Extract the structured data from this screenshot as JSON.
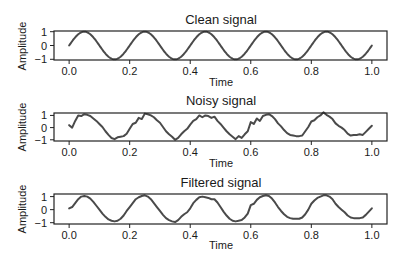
{
  "figure": {
    "width": 409,
    "height": 261,
    "line_color": "#4a4a4a",
    "axis_color": "#222222"
  },
  "chart_data": [
    {
      "type": "line",
      "title": "Clean signal",
      "xlabel": "Time",
      "ylabel": "Amplitude",
      "xlim": [
        -0.05,
        1.05
      ],
      "ylim": [
        -1.05,
        1.05
      ],
      "xticks": [
        0.0,
        0.2,
        0.4,
        0.6,
        0.8,
        1.0
      ],
      "xtick_labels": [
        "0.0",
        "0.2",
        "0.4",
        "0.6",
        "0.8",
        "1.0"
      ],
      "yticks": [
        1,
        0,
        -1
      ],
      "ytick_labels": [
        "1",
        "0",
        "−1"
      ],
      "grid": false,
      "description": "Sine wave, 5 cycles over t in [0,1], amplitude 1",
      "x": [
        0.0,
        0.025,
        0.05,
        0.075,
        0.1,
        0.125,
        0.15,
        0.175,
        0.2,
        0.225,
        0.25,
        0.275,
        0.3,
        0.325,
        0.35,
        0.375,
        0.4,
        0.425,
        0.45,
        0.475,
        0.5,
        0.525,
        0.55,
        0.575,
        0.6,
        0.625,
        0.65,
        0.675,
        0.7,
        0.725,
        0.75,
        0.775,
        0.8,
        0.825,
        0.85,
        0.875,
        0.9,
        0.925,
        0.95,
        0.975,
        1.0
      ],
      "values": [
        0.0,
        0.71,
        1.0,
        0.71,
        0.0,
        -0.71,
        -1.0,
        -0.71,
        0.0,
        0.71,
        1.0,
        0.71,
        0.0,
        -0.71,
        -1.0,
        -0.71,
        0.0,
        0.71,
        1.0,
        0.71,
        0.0,
        -0.71,
        -1.0,
        -0.71,
        0.0,
        0.71,
        1.0,
        0.71,
        0.0,
        -0.71,
        -1.0,
        -0.71,
        0.0,
        0.71,
        1.0,
        0.71,
        0.0,
        -0.71,
        -1.0,
        -0.71,
        0.0
      ]
    },
    {
      "type": "line",
      "title": "Noisy signal",
      "xlabel": "Time",
      "ylabel": "Amplitude",
      "xlim": [
        -0.05,
        1.05
      ],
      "ylim": [
        -1.1,
        1.2
      ],
      "xticks": [
        0.0,
        0.2,
        0.4,
        0.6,
        0.8,
        1.0
      ],
      "xtick_labels": [
        "0.0",
        "0.2",
        "0.4",
        "0.6",
        "0.8",
        "1.0"
      ],
      "yticks": [
        1,
        0,
        -1
      ],
      "ytick_labels": [
        "1",
        "0",
        "−1"
      ],
      "grid": false,
      "x": [
        0.0,
        0.01,
        0.02,
        0.03,
        0.04,
        0.05,
        0.06,
        0.07,
        0.08,
        0.09,
        0.1,
        0.11,
        0.12,
        0.13,
        0.14,
        0.15,
        0.16,
        0.17,
        0.18,
        0.19,
        0.2,
        0.21,
        0.22,
        0.23,
        0.24,
        0.25,
        0.26,
        0.27,
        0.28,
        0.29,
        0.3,
        0.31,
        0.32,
        0.33,
        0.34,
        0.35,
        0.36,
        0.37,
        0.38,
        0.39,
        0.4,
        0.41,
        0.42,
        0.43,
        0.44,
        0.45,
        0.46,
        0.47,
        0.48,
        0.49,
        0.5,
        0.51,
        0.52,
        0.53,
        0.54,
        0.55,
        0.56,
        0.57,
        0.58,
        0.59,
        0.6,
        0.61,
        0.62,
        0.63,
        0.64,
        0.65,
        0.66,
        0.67,
        0.68,
        0.69,
        0.7,
        0.71,
        0.72,
        0.73,
        0.74,
        0.75,
        0.76,
        0.77,
        0.78,
        0.79,
        0.8,
        0.81,
        0.82,
        0.83,
        0.84,
        0.85,
        0.86,
        0.87,
        0.88,
        0.89,
        0.9,
        0.91,
        0.92,
        0.93,
        0.94,
        0.95,
        0.96,
        0.97,
        0.98,
        0.99,
        1.0
      ],
      "values": [
        0.2,
        0.0,
        0.55,
        1.0,
        0.95,
        1.1,
        1.05,
        0.95,
        0.75,
        0.55,
        0.3,
        0.05,
        -0.3,
        -0.6,
        -0.85,
        -0.95,
        -0.8,
        -0.75,
        -0.7,
        -0.5,
        -0.1,
        0.3,
        0.4,
        0.8,
        0.7,
        1.15,
        1.1,
        1.0,
        0.85,
        0.6,
        0.4,
        0.05,
        -0.3,
        -0.55,
        -0.75,
        -1.0,
        -0.85,
        -0.55,
        -0.3,
        -0.1,
        0.25,
        0.55,
        0.7,
        1.0,
        0.85,
        1.0,
        0.95,
        0.8,
        0.9,
        0.55,
        0.3,
        0.0,
        -0.3,
        -0.55,
        -0.75,
        -0.95,
        -0.7,
        -0.85,
        -0.55,
        -0.3,
        0.45,
        0.3,
        0.75,
        0.55,
        0.95,
        1.05,
        1.1,
        0.95,
        0.7,
        0.35,
        0.1,
        -0.2,
        -0.45,
        -0.6,
        -0.65,
        -0.7,
        -0.7,
        -0.65,
        -0.3,
        0.05,
        0.5,
        0.6,
        0.85,
        1.0,
        1.25,
        1.05,
        0.9,
        0.7,
        0.35,
        0.15,
        0.0,
        -0.2,
        -0.5,
        -0.65,
        -0.6,
        -0.6,
        -0.55,
        -0.6,
        -0.35,
        -0.1,
        0.15
      ]
    },
    {
      "type": "line",
      "title": "Filtered signal",
      "xlabel": "Time",
      "ylabel": "Amplitude",
      "xlim": [
        -0.05,
        1.05
      ],
      "ylim": [
        -1.1,
        1.2
      ],
      "xticks": [
        0.0,
        0.2,
        0.4,
        0.6,
        0.8,
        1.0
      ],
      "xtick_labels": [
        "0.0",
        "0.2",
        "0.4",
        "0.6",
        "0.8",
        "1.0"
      ],
      "yticks": [
        1,
        0,
        -1
      ],
      "ytick_labels": [
        "1",
        "0",
        "−1"
      ],
      "grid": false,
      "x": [
        0.0,
        0.01,
        0.02,
        0.03,
        0.04,
        0.05,
        0.06,
        0.07,
        0.08,
        0.09,
        0.1,
        0.11,
        0.12,
        0.13,
        0.14,
        0.15,
        0.16,
        0.17,
        0.18,
        0.19,
        0.2,
        0.21,
        0.22,
        0.23,
        0.24,
        0.25,
        0.26,
        0.27,
        0.28,
        0.29,
        0.3,
        0.31,
        0.32,
        0.33,
        0.34,
        0.35,
        0.36,
        0.37,
        0.38,
        0.39,
        0.4,
        0.41,
        0.42,
        0.43,
        0.44,
        0.45,
        0.46,
        0.47,
        0.48,
        0.49,
        0.5,
        0.51,
        0.52,
        0.53,
        0.54,
        0.55,
        0.56,
        0.57,
        0.58,
        0.59,
        0.6,
        0.61,
        0.62,
        0.63,
        0.64,
        0.65,
        0.66,
        0.67,
        0.68,
        0.69,
        0.7,
        0.71,
        0.72,
        0.73,
        0.74,
        0.75,
        0.76,
        0.77,
        0.78,
        0.79,
        0.8,
        0.81,
        0.82,
        0.83,
        0.84,
        0.85,
        0.86,
        0.87,
        0.88,
        0.89,
        0.9,
        0.91,
        0.92,
        0.93,
        0.94,
        0.95,
        0.96,
        0.97,
        0.98,
        0.99,
        1.0
      ],
      "values": [
        0.1,
        0.2,
        0.5,
        0.8,
        1.0,
        1.05,
        1.0,
        0.85,
        0.6,
        0.3,
        0.0,
        -0.3,
        -0.55,
        -0.75,
        -0.85,
        -0.9,
        -0.85,
        -0.7,
        -0.45,
        -0.1,
        0.2,
        0.5,
        0.8,
        0.95,
        1.05,
        1.1,
        1.0,
        0.8,
        0.5,
        0.2,
        -0.1,
        -0.4,
        -0.65,
        -0.8,
        -0.9,
        -0.95,
        -0.8,
        -0.55,
        -0.35,
        -0.2,
        0.1,
        0.5,
        0.75,
        0.95,
        1.0,
        0.95,
        0.9,
        0.8,
        0.8,
        0.55,
        0.2,
        -0.15,
        -0.45,
        -0.7,
        -0.85,
        -0.9,
        -0.85,
        -0.8,
        -0.6,
        -0.3,
        0.35,
        0.45,
        0.75,
        0.95,
        1.05,
        1.1,
        1.05,
        0.85,
        0.55,
        0.2,
        -0.1,
        -0.35,
        -0.55,
        -0.65,
        -0.7,
        -0.7,
        -0.7,
        -0.6,
        -0.35,
        0.0,
        0.45,
        0.7,
        0.9,
        1.0,
        1.1,
        1.1,
        1.0,
        0.8,
        0.45,
        0.2,
        0.0,
        -0.2,
        -0.45,
        -0.6,
        -0.65,
        -0.65,
        -0.65,
        -0.6,
        -0.4,
        -0.15,
        0.1
      ]
    }
  ]
}
